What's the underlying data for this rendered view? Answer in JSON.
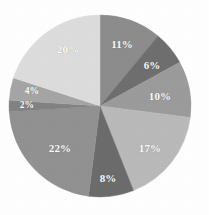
{
  "chart_data": {
    "type": "pie",
    "title": "",
    "subtitle": "",
    "xlabel": "",
    "ylabel": "",
    "legend": "none",
    "grid": false,
    "units": "percent",
    "start_angle_deg": 0,
    "direction": "clockwise",
    "center": {
      "cx": 100,
      "cy": 106,
      "r": 91
    },
    "background_color": "#fefefe",
    "label_color": "#ffffff",
    "categories": [
      "Segment 1",
      "Segment 2",
      "Segment 3",
      "Segment 4",
      "Segment 5",
      "Segment 6",
      "Segment 7",
      "Segment 8",
      "Segment 9"
    ],
    "values": [
      11,
      6,
      10,
      17,
      8,
      22,
      2,
      4,
      20
    ],
    "total": 100,
    "slices": [
      {
        "label": "11%",
        "value": 11,
        "color": "#8c8c8c",
        "start_deg": 0,
        "end_deg": 39.6,
        "label_x": 122,
        "label_y": 44
      },
      {
        "label": "6%",
        "value": 6,
        "color": "#6e6e6e",
        "start_deg": 39.6,
        "end_deg": 61.2,
        "label_x": 152,
        "label_y": 65
      },
      {
        "label": "10%",
        "value": 10,
        "color": "#9b9b9b",
        "start_deg": 61.2,
        "end_deg": 97.2,
        "label_x": 160,
        "label_y": 96
      },
      {
        "label": "17%",
        "value": 17,
        "color": "#b9b9b9",
        "start_deg": 97.2,
        "end_deg": 158.4,
        "label_x": 150,
        "label_y": 148
      },
      {
        "label": "8%",
        "value": 8,
        "color": "#6b6b6b",
        "start_deg": 158.4,
        "end_deg": 187.2,
        "label_x": 108,
        "label_y": 178
      },
      {
        "label": "22%",
        "value": 22,
        "color": "#919191",
        "start_deg": 187.2,
        "end_deg": 266.4,
        "label_x": 60,
        "label_y": 148
      },
      {
        "label": "2%",
        "value": 2,
        "color": "#828282",
        "start_deg": 266.4,
        "end_deg": 273.6,
        "label_x": 27,
        "label_y": 106
      },
      {
        "label": "4%",
        "value": 4,
        "color": "#a5a5a5",
        "start_deg": 273.6,
        "end_deg": 288.0,
        "label_x": 32,
        "label_y": 92
      },
      {
        "label": "20%",
        "value": 20,
        "color": "#dcdcdc",
        "start_deg": 288.0,
        "end_deg": 360.0,
        "label_x": 68,
        "label_y": 49
      }
    ]
  }
}
